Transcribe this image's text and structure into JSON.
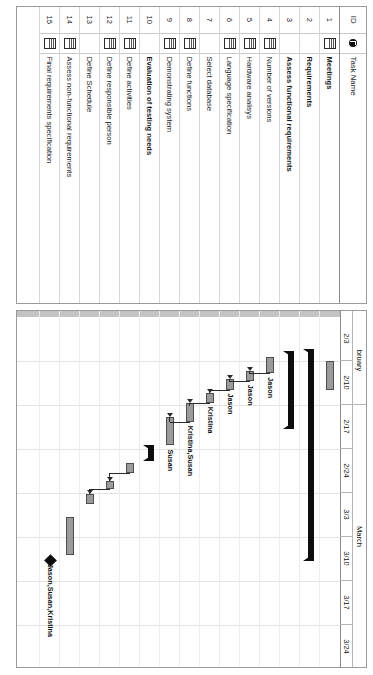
{
  "app": {
    "title": "Gantt Chart",
    "view": "Microsoft Project Gantt Chart"
  },
  "grid": {
    "columns": [
      {
        "key": "id",
        "label": "ID"
      },
      {
        "key": "indicator",
        "label": "indicator-icon"
      },
      {
        "key": "name",
        "label": "Task Name"
      }
    ],
    "rows": [
      {
        "id": "1",
        "indicator": "note-icon",
        "name": "Meetings",
        "level": 1,
        "bold": false
      },
      {
        "id": "2",
        "indicator": "",
        "name": "Requirements",
        "level": 0,
        "bold": true
      },
      {
        "id": "3",
        "indicator": "",
        "name": "Assess functional requirements",
        "level": 1,
        "bold": true
      },
      {
        "id": "4",
        "indicator": "note-icon",
        "name": "Number of versions",
        "level": 2,
        "bold": false
      },
      {
        "id": "5",
        "indicator": "note-icon",
        "name": "Hardware analisys",
        "level": 2,
        "bold": false
      },
      {
        "id": "6",
        "indicator": "note-icon",
        "name": "Language specification",
        "level": 2,
        "bold": false
      },
      {
        "id": "7",
        "indicator": "",
        "name": "Select database",
        "level": 2,
        "bold": false
      },
      {
        "id": "8",
        "indicator": "note-icon",
        "name": "Define functions",
        "level": 2,
        "bold": false
      },
      {
        "id": "9",
        "indicator": "note-icon",
        "name": "Demonstrating system",
        "level": 2,
        "bold": false
      },
      {
        "id": "10",
        "indicator": "",
        "name": "Evaluation of testing needs",
        "level": 1,
        "bold": true
      },
      {
        "id": "11",
        "indicator": "note-icon",
        "name": "Define activities",
        "level": 2,
        "bold": false
      },
      {
        "id": "12",
        "indicator": "note-icon",
        "name": "Define responsible person",
        "level": 2,
        "bold": false
      },
      {
        "id": "13",
        "indicator": "",
        "name": "Define Schedule",
        "level": 2,
        "bold": false
      },
      {
        "id": "14",
        "indicator": "note-icon",
        "name": "Assess non-functional requirements",
        "level": 2,
        "bold": false
      },
      {
        "id": "15",
        "indicator": "note-icon",
        "name": "Final requirements specification",
        "level": 2,
        "bold": false
      }
    ]
  },
  "timescale": {
    "major": [
      {
        "label": "bruary",
        "span": 2
      },
      {
        "label": "March",
        "span": 6
      }
    ],
    "minor": [
      "2/3",
      "2/10",
      "2/17",
      "2/24",
      "3/3",
      "3/10",
      "3/17",
      "3/24"
    ]
  },
  "chart_data": {
    "type": "bar",
    "xlabel": "",
    "ylabel": "",
    "categories": [
      "Meetings",
      "Requirements",
      "Assess functional requirements",
      "Number of versions",
      "Hardware analisys",
      "Language specification",
      "Select database",
      "Define functions",
      "Demonstrating system",
      "Evaluation of testing needs",
      "Define activities",
      "Define responsible person",
      "Define Schedule",
      "Assess non-functional requirements",
      "Final requirements specification"
    ],
    "axis_ticks": [
      "2/3",
      "2/10",
      "2/17",
      "2/24",
      "3/3",
      "3/10",
      "3/17",
      "3/24"
    ],
    "bars": [
      {
        "row": 1,
        "kind": "bar",
        "start": 2.0,
        "end": 2.65,
        "resource": ""
      },
      {
        "row": 2,
        "kind": "summary",
        "start": 1.72,
        "end": 6.55,
        "resource": ""
      },
      {
        "row": 3,
        "kind": "summary",
        "start": 1.78,
        "end": 3.55,
        "resource": ""
      },
      {
        "row": 4,
        "kind": "bar",
        "start": 1.9,
        "end": 2.28,
        "resource": "Jason"
      },
      {
        "row": 5,
        "kind": "bar",
        "start": 2.22,
        "end": 2.45,
        "resource": "Jason"
      },
      {
        "row": 6,
        "kind": "bar",
        "start": 2.42,
        "end": 2.65,
        "resource": "Jason"
      },
      {
        "row": 7,
        "kind": "bar",
        "start": 2.72,
        "end": 2.95,
        "resource": "Kristina"
      },
      {
        "row": 8,
        "kind": "bar",
        "start": 2.96,
        "end": 3.38,
        "resource": "Kristina,Susan"
      },
      {
        "row": 9,
        "kind": "bar",
        "start": 3.28,
        "end": 3.92,
        "resource": "Susan"
      },
      {
        "row": 10,
        "kind": "summary",
        "start": 3.9,
        "end": 4.28,
        "resource": ""
      },
      {
        "row": 11,
        "kind": "bar",
        "start": 4.32,
        "end": 4.55,
        "resource": ""
      },
      {
        "row": 12,
        "kind": "bar",
        "start": 4.72,
        "end": 4.92,
        "resource": ""
      },
      {
        "row": 13,
        "kind": "bar",
        "start": 5.02,
        "end": 5.25,
        "resource": ""
      },
      {
        "row": 14,
        "kind": "bar",
        "start": 5.55,
        "end": 6.4,
        "resource": ""
      },
      {
        "row": 15,
        "kind": "milestone",
        "start": 6.52,
        "end": 6.52,
        "resource": "Jason,Susan,Kristina"
      }
    ]
  },
  "bar_labels": [
    "Jason",
    "Jason",
    "Jason",
    "Kristina",
    "Kristina,Susan",
    "Susan",
    "Jason,Susan,Kristina"
  ]
}
